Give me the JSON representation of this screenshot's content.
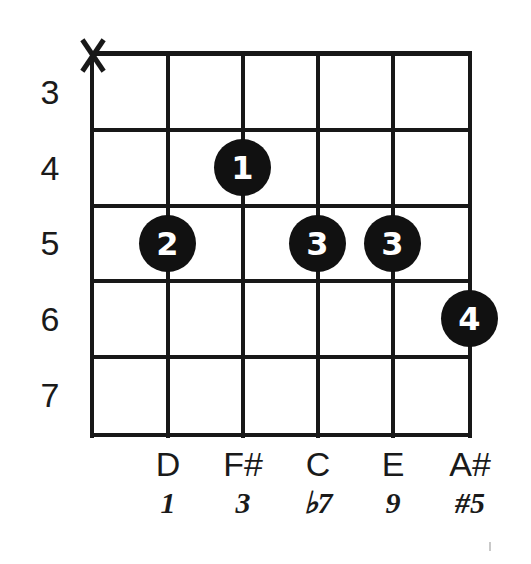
{
  "diagram": {
    "type": "guitar-chord-diagram",
    "string_count": 6,
    "fret_count": 5,
    "geometry": {
      "grid_left": 92,
      "grid_top": 53,
      "grid_right": 470,
      "grid_bottom": 435,
      "string_x": [
        92,
        168,
        243,
        318,
        393,
        470
      ],
      "fret_y": [
        53,
        130,
        206,
        281,
        357,
        435
      ],
      "dot_diameter": 57
    },
    "colors": {
      "ink": "#181818",
      "dot_fill": "#111111",
      "dot_text": "#ffffff",
      "background": "#ffffff"
    }
  },
  "fret_numbers": [
    {
      "label": "3",
      "fret_index": 0
    },
    {
      "label": "4",
      "fret_index": 1
    },
    {
      "label": "5",
      "fret_index": 2
    },
    {
      "label": "6",
      "fret_index": 3
    },
    {
      "label": "7",
      "fret_index": 4
    }
  ],
  "muted_strings": [
    {
      "marker": "X",
      "string_index": 0
    }
  ],
  "finger_dots": [
    {
      "finger": "1",
      "string_index": 2,
      "fret_index": 1,
      "fret_label": "4"
    },
    {
      "finger": "2",
      "string_index": 1,
      "fret_index": 2,
      "fret_label": "5"
    },
    {
      "finger": "3",
      "string_index": 3,
      "fret_index": 2,
      "fret_label": "5"
    },
    {
      "finger": "3",
      "string_index": 4,
      "fret_index": 2,
      "fret_label": "5"
    },
    {
      "finger": "4",
      "string_index": 5,
      "fret_index": 3,
      "fret_label": "6"
    }
  ],
  "string_labels": [
    {
      "string_index": 0,
      "note": "",
      "interval": ""
    },
    {
      "string_index": 1,
      "note": "D",
      "interval": "1"
    },
    {
      "string_index": 2,
      "note": "F#",
      "interval": "3"
    },
    {
      "string_index": 3,
      "note": "C",
      "interval": "♭7"
    },
    {
      "string_index": 4,
      "note": "E",
      "interval": "9"
    },
    {
      "string_index": 5,
      "note": "A#",
      "interval": "#5"
    }
  ]
}
